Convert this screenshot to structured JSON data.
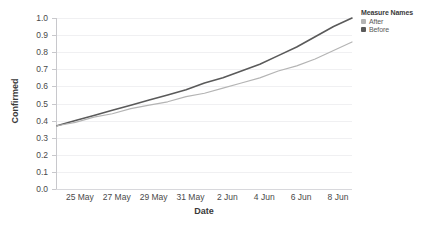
{
  "chart_data": {
    "type": "line",
    "title": "",
    "xlabel": "Date",
    "ylabel": "Confirmed",
    "ylim": [
      0.0,
      1.0
    ],
    "grid": true,
    "legend_position": "top-right",
    "legend_title": "Measure Names",
    "ytick_labels": [
      "1.0",
      "0.9",
      "0.8",
      "0.7",
      "0.6",
      "0.5",
      "0.4",
      "0.3",
      "0.2",
      "0.1",
      "0.0"
    ],
    "ytick_values": [
      1.0,
      0.9,
      0.8,
      0.7,
      0.6,
      0.5,
      0.4,
      0.3,
      0.2,
      0.1,
      0.0
    ],
    "xtick_labels": [
      "25 May",
      "27 May",
      "29 May",
      "31 May",
      "2 Jun",
      "4 Jun",
      "6 Jun",
      "8 Jun"
    ],
    "x": [
      "24 May",
      "25 May",
      "26 May",
      "27 May",
      "28 May",
      "29 May",
      "30 May",
      "31 May",
      "1 Jun",
      "2 Jun",
      "3 Jun",
      "4 Jun",
      "5 Jun",
      "6 Jun",
      "7 Jun",
      "8 Jun",
      "9 Jun"
    ],
    "series": [
      {
        "name": "Before",
        "color": "#5a5a5a",
        "values": [
          0.37,
          0.4,
          0.43,
          0.46,
          0.49,
          0.52,
          0.55,
          0.58,
          0.62,
          0.65,
          0.69,
          0.73,
          0.78,
          0.83,
          0.89,
          0.95,
          1.0
        ]
      },
      {
        "name": "After",
        "color": "#b4b4b4",
        "values": [
          0.37,
          0.39,
          0.42,
          0.44,
          0.47,
          0.49,
          0.51,
          0.54,
          0.56,
          0.59,
          0.62,
          0.65,
          0.69,
          0.72,
          0.76,
          0.81,
          0.86
        ]
      }
    ]
  },
  "legend": {
    "title": "Measure Names",
    "items": [
      {
        "label": "After",
        "color": "#b4b4b4"
      },
      {
        "label": "Before",
        "color": "#5a5a5a"
      }
    ]
  },
  "axes": {
    "y_title": "Confirmed",
    "x_title": "Date"
  }
}
